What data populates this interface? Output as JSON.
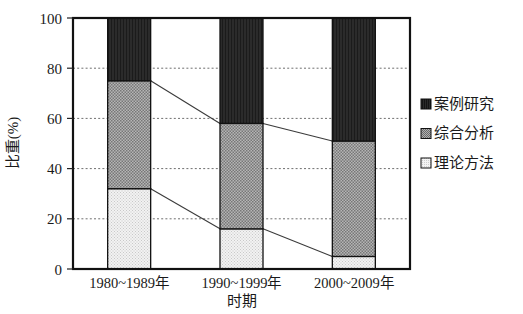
{
  "chart_data": {
    "type": "bar",
    "subtype": "100% stacked bar",
    "title": "",
    "xlabel": "时期",
    "ylabel": "比重(%)",
    "categories": [
      "1980~1989年",
      "1990~1999年",
      "2000~2009年"
    ],
    "ylim": [
      0,
      100
    ],
    "yticks": [
      0,
      20,
      40,
      60,
      80,
      100
    ],
    "ytick_labels": [
      "0",
      "20",
      "40",
      "60",
      "80",
      "100"
    ],
    "grid": true,
    "grid_axis": "y",
    "legend_position": "right",
    "series": [
      {
        "name": "案例研究",
        "color": "#2b2b2b",
        "pattern": "solid-dark",
        "values": [
          25,
          42,
          49
        ]
      },
      {
        "name": "综合分析",
        "color": "#9c9c9c",
        "pattern": "medium-dotted",
        "values": [
          43,
          42,
          46
        ]
      },
      {
        "name": "理论方法",
        "color": "#ededed",
        "pattern": "light-dotted",
        "values": [
          32,
          16,
          5
        ]
      }
    ],
    "stack_order_bottom_to_top": [
      "理论方法",
      "综合分析",
      "案例研究"
    ],
    "cumulative_boundaries": {
      "1980~1989年": [
        32,
        75
      ],
      "1990~1999年": [
        16,
        58
      ],
      "2000~2009年": [
        5,
        51
      ]
    },
    "connectors": [
      {
        "from": "1980~1989年",
        "to": "1990~1999年",
        "level_from": 75,
        "level_to": 58
      },
      {
        "from": "1990~1999年",
        "to": "2000~2009年",
        "level_from": 58,
        "level_to": 51
      },
      {
        "from": "1980~1989年",
        "to": "1990~1999年",
        "level_from": 32,
        "level_to": 16
      },
      {
        "from": "1990~1999年",
        "to": "2000~2009年",
        "level_from": 16,
        "level_to": 5
      }
    ]
  },
  "legend": {
    "items": [
      {
        "label": "案例研究"
      },
      {
        "label": "综合分析"
      },
      {
        "label": "理论方法"
      }
    ]
  }
}
